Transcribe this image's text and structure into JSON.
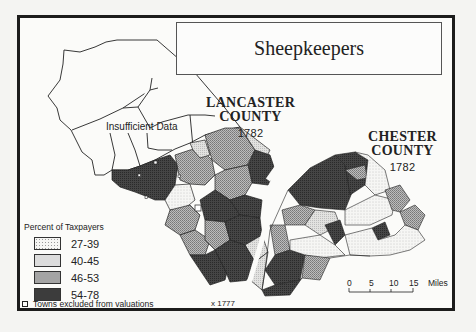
{
  "map": {
    "title": "Sheepkeepers",
    "counties": [
      {
        "name_line1": "LANCASTER",
        "name_line2": "COUNTY",
        "year": "1782"
      },
      {
        "name_line1": "CHESTER",
        "name_line2": "COUNTY",
        "year": "1782"
      }
    ],
    "insufficient_data_label": "Insufficient Data",
    "marker_1777": "x 1777"
  },
  "legend": {
    "title": "Percent of Taxpayers",
    "classes": [
      {
        "label": "27-39",
        "color": "#f0f0ee"
      },
      {
        "label": "40-45",
        "color": "#dcdcdc"
      },
      {
        "label": "46-53",
        "color": "#a4a4a4"
      },
      {
        "label": "54-78",
        "color": "#3c3c3c"
      }
    ],
    "towns_note": "Towns excluded from valuations"
  },
  "scale_bar": {
    "ticks": [
      "0",
      "5",
      "10",
      "15"
    ],
    "unit": "Miles"
  }
}
